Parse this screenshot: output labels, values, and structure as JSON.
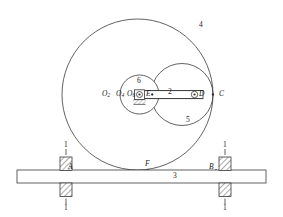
{
  "figure": {
    "type": "mechanism-kinematic-diagram",
    "stroke_color": "#333333",
    "fill_color": "#ffffff",
    "background": "#ffffff"
  },
  "labels": {
    "frame_left_top": "1",
    "frame_left_bottom": "1",
    "frame_right_top": "1",
    "frame_right_bottom": "1",
    "rack": "3",
    "gear_large": "4",
    "gear_right": "5",
    "gear_small": "6",
    "link": "2",
    "point_A": "A",
    "point_B": "B",
    "point_C": "C",
    "point_D": "D",
    "point_E": "E",
    "point_F": "F",
    "center_O2_base": "O",
    "center_O2_sub": "2",
    "center_O4_base": "O",
    "center_O4_sub": "4",
    "center_O6_base": "O",
    "center_O6_sub": "6"
  },
  "geometry": {
    "gear_large": {
      "cx": 137.5,
      "cy": 94.5,
      "r": 75.5
    },
    "gear_right": {
      "cx": 182.0,
      "cy": 94.5,
      "r": 31.0
    },
    "gear_small": {
      "cx": 139.5,
      "cy": 94.5,
      "r": 19.5
    },
    "link": {
      "x1": 137.5,
      "y1": 91.0,
      "x2": 204.0,
      "y2": 98.0
    },
    "rack": {
      "x": 17.0,
      "y": 170.0,
      "width": 249.0,
      "height": 13.0
    },
    "points": {
      "A": [
        66.0,
        170.0
      ],
      "B": [
        216.0,
        170.0
      ],
      "C": [
        213.0,
        94.5
      ],
      "D": [
        196.0,
        94.5
      ],
      "E": [
        152.0,
        94.5
      ],
      "F": [
        148.0,
        170.0
      ],
      "O6": [
        139.5,
        94.5
      ]
    }
  }
}
